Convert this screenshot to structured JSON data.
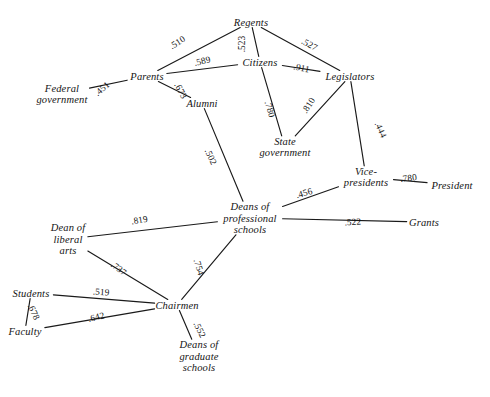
{
  "figure": {
    "title_fragment": "",
    "background_color": "#ffffff",
    "line_color": "#1a1a1a",
    "text_color": "#141414"
  },
  "chart_data": {
    "type": "diagram",
    "subtype": "node-link network graph",
    "title": "",
    "xlabel": "",
    "ylabel": "",
    "grid": false,
    "legend": "none",
    "node_label_style": "italic serif",
    "edge_label_style": "rotated along edge, leading decimal point",
    "nodes": [
      {
        "id": "regents",
        "label": "Regents",
        "x": 251,
        "y": 22,
        "anchor": "middle"
      },
      {
        "id": "citizens",
        "label": "Citizens",
        "x": 260,
        "y": 62,
        "anchor": "middle"
      },
      {
        "id": "legislators",
        "label": "Legislators",
        "x": 350,
        "y": 76,
        "anchor": "middle"
      },
      {
        "id": "parents",
        "label": "Parents",
        "x": 147,
        "y": 76,
        "anchor": "middle"
      },
      {
        "id": "federal_gov",
        "label": "Federal government",
        "x": 62,
        "y": 94,
        "anchor": "middle"
      },
      {
        "id": "alumni",
        "label": "Alumni",
        "x": 202,
        "y": 103,
        "anchor": "middle"
      },
      {
        "id": "state_gov",
        "label": "State government",
        "x": 285,
        "y": 147,
        "anchor": "middle"
      },
      {
        "id": "vice_pres",
        "label": "Vice-presidents",
        "x": 366,
        "y": 177,
        "anchor": "middle"
      },
      {
        "id": "president",
        "label": "President",
        "x": 452,
        "y": 185,
        "anchor": "middle"
      },
      {
        "id": "deans_prof",
        "label": "Deans of professional schools",
        "x": 250,
        "y": 218,
        "anchor": "middle"
      },
      {
        "id": "grants",
        "label": "Grants",
        "x": 424,
        "y": 222,
        "anchor": "middle"
      },
      {
        "id": "dean_liberal",
        "label": "Dean of liberal arts",
        "x": 68,
        "y": 239,
        "anchor": "middle"
      },
      {
        "id": "students",
        "label": "Students",
        "x": 31,
        "y": 293,
        "anchor": "middle"
      },
      {
        "id": "faculty",
        "label": "Faculty",
        "x": 25,
        "y": 331,
        "anchor": "middle"
      },
      {
        "id": "chairmen",
        "label": "Chairmen",
        "x": 177,
        "y": 305,
        "anchor": "middle"
      },
      {
        "id": "deans_grad",
        "label": "Deans of graduate schools",
        "x": 199,
        "y": 356,
        "anchor": "middle"
      }
    ],
    "edges": [
      {
        "source": "parents",
        "target": "regents",
        "value": ".510",
        "label_x": 179,
        "label_y": 45,
        "label_rot": -33
      },
      {
        "source": "regents",
        "target": "citizens",
        "value": ".523",
        "label_x": 245,
        "label_y": 44,
        "label_rot": -90
      },
      {
        "source": "regents",
        "target": "legislators",
        "value": ".527",
        "label_x": 308,
        "label_y": 47,
        "label_rot": 28
      },
      {
        "source": "parents",
        "target": "citizens",
        "value": ".589",
        "label_x": 203,
        "label_y": 64,
        "label_rot": -14
      },
      {
        "source": "citizens",
        "target": "legislators",
        "value": ".911",
        "label_x": 301,
        "label_y": 71,
        "label_rot": 12
      },
      {
        "source": "federal_gov",
        "target": "parents",
        "value": ".451",
        "label_x": 104,
        "label_y": 91,
        "label_rot": -41
      },
      {
        "source": "parents",
        "target": "alumni",
        "value": ".673",
        "label_x": 178,
        "label_y": 92,
        "label_rot": 62
      },
      {
        "source": "citizens",
        "target": "state_gov",
        "value": ".780",
        "label_x": 267,
        "label_y": 110,
        "label_rot": 72
      },
      {
        "source": "state_gov",
        "target": "legislators",
        "value": ".810",
        "label_x": 311,
        "label_y": 107,
        "label_rot": -58
      },
      {
        "source": "legislators",
        "target": "vice_pres",
        "value": ".444",
        "label_x": 378,
        "label_y": 131,
        "label_rot": 66
      },
      {
        "source": "alumni",
        "target": "deans_prof",
        "value": ".502",
        "label_x": 208,
        "label_y": 158,
        "label_rot": 65
      },
      {
        "source": "deans_prof",
        "target": "vice_pres",
        "value": ".456",
        "label_x": 305,
        "label_y": 196,
        "label_rot": -16
      },
      {
        "source": "vice_pres",
        "target": "president",
        "value": ".780",
        "label_x": 409,
        "label_y": 181,
        "label_rot": -7
      },
      {
        "source": "deans_prof",
        "target": "grants",
        "value": ".522",
        "label_x": 353,
        "label_y": 225,
        "label_rot": -3
      },
      {
        "source": "dean_liberal",
        "target": "deans_prof",
        "value": ".819",
        "label_x": 140,
        "label_y": 223,
        "label_rot": -10
      },
      {
        "source": "dean_liberal",
        "target": "chairmen",
        "value": ".737",
        "label_x": 117,
        "label_y": 271,
        "label_rot": 37
      },
      {
        "source": "deans_prof",
        "target": "chairmen",
        "value": ".754",
        "label_x": 196,
        "label_y": 268,
        "label_rot": 72
      },
      {
        "source": "students",
        "target": "chairmen",
        "value": ".519",
        "label_x": 101,
        "label_y": 295,
        "label_rot": 4
      },
      {
        "source": "students",
        "target": "faculty",
        "value": ".678",
        "label_x": 31,
        "label_y": 313,
        "label_rot": 66
      },
      {
        "source": "faculty",
        "target": "chairmen",
        "value": ".642",
        "label_x": 97,
        "label_y": 320,
        "label_rot": -14
      },
      {
        "source": "chairmen",
        "target": "deans_grad",
        "value": ".552",
        "label_x": 197,
        "label_y": 331,
        "label_rot": 63
      }
    ]
  }
}
